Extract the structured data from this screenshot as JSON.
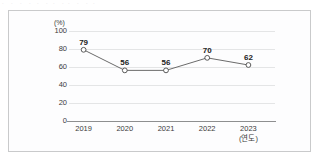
{
  "artifact": {
    "top_clipped_text": "ㆍ  ㆍ ㆍ  ㆍ ㆍ  ㆍㆍ  ㆍㆍ  ㆍ  ㆍㆍ"
  },
  "chart_data": {
    "type": "line",
    "title": "",
    "xlabel": "(연도)",
    "ylabel": "(%)",
    "categories": [
      "2019",
      "2020",
      "2021",
      "2022",
      "2023"
    ],
    "values": [
      79,
      56,
      56,
      70,
      62
    ],
    "data_labels": [
      "79",
      "56",
      "56",
      "70",
      "62"
    ],
    "ylim": [
      0,
      100
    ],
    "yticks": [
      "100",
      "80",
      "60",
      "40",
      "20",
      "0"
    ],
    "grid": "horizontal",
    "legend": "none",
    "marker": "open-circle",
    "colors": {
      "line": "#6b6b6b",
      "marker_fill": "#ffffff",
      "marker_edge": "#4a4a4a",
      "grid": "#e4e5e6",
      "axis": "#8e8f90",
      "text": "#3b3b3b",
      "label_text": "#222222",
      "frame": "#c9cacb",
      "background": "#fdfdfe"
    }
  }
}
